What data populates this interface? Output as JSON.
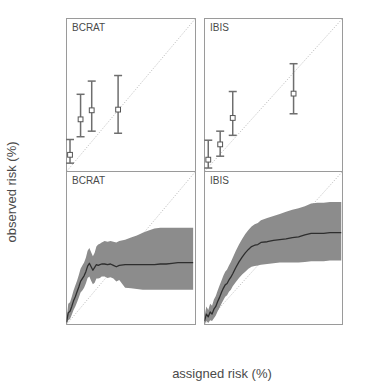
{
  "figure": {
    "xlabel": "assigned risk (%)",
    "ylabel": "observed risk (%)"
  },
  "panels": {
    "top_left_label": "BCRAT",
    "top_right_label": "IBIS",
    "bottom_left_label": "BCRAT",
    "bottom_right_label": "IBIS"
  },
  "axis": {
    "x_ticks": [
      "0",
      "5",
      "10",
      "15",
      "20"
    ],
    "y_ticks": [
      "0",
      "5",
      "10",
      "15",
      "20"
    ],
    "x_tick_values": [
      0,
      5,
      10,
      15,
      20
    ],
    "y_tick_values": [
      0,
      5,
      10,
      15,
      20
    ]
  },
  "colors": {
    "band": "#8c8c8c",
    "curve": "#2e2e2e",
    "errorbar": "#6e6e6e",
    "marker_fill": "#ffffff",
    "diagonal": "#b0b0b0",
    "frame": "#9a9a9a",
    "text": "#4a4a4a"
  },
  "chart_data": [
    {
      "type": "scatter",
      "title": "BCRAT",
      "panel": "top-left",
      "xlabel": "assigned risk (%)",
      "ylabel": "observed risk (%)",
      "xlim": [
        0,
        22
      ],
      "ylim": [
        0,
        22
      ],
      "grid": false,
      "legend": "none",
      "annotations": [
        "diagonal reference line y = x (dotted)"
      ],
      "points": [
        {
          "x": 0.6,
          "y": 2.4,
          "ci_low": 1.2,
          "ci_high": 4.6
        },
        {
          "x": 2.4,
          "y": 7.5,
          "ci_low": 5.0,
          "ci_high": 11.1
        },
        {
          "x": 4.3,
          "y": 8.8,
          "ci_low": 5.8,
          "ci_high": 13.0
        },
        {
          "x": 8.8,
          "y": 8.9,
          "ci_low": 5.5,
          "ci_high": 13.8
        }
      ]
    },
    {
      "type": "scatter",
      "title": "IBIS",
      "panel": "top-right",
      "xlabel": "assigned risk (%)",
      "ylabel": "observed risk (%)",
      "xlim": [
        0,
        22
      ],
      "ylim": [
        0,
        22
      ],
      "grid": false,
      "legend": "none",
      "annotations": [
        "diagonal reference line y = x (dotted)"
      ],
      "points": [
        {
          "x": 0.6,
          "y": 1.7,
          "ci_low": 0.5,
          "ci_high": 4.5
        },
        {
          "x": 2.5,
          "y": 3.9,
          "ci_low": 2.2,
          "ci_high": 5.8
        },
        {
          "x": 4.5,
          "y": 7.7,
          "ci_low": 5.2,
          "ci_high": 11.5
        },
        {
          "x": 14.2,
          "y": 11.2,
          "ci_low": 8.3,
          "ci_high": 15.5
        }
      ]
    },
    {
      "type": "area",
      "title": "BCRAT",
      "panel": "bottom-left",
      "xlabel": "assigned risk (%)",
      "ylabel": "observed risk (%)",
      "xlim": [
        0,
        22
      ],
      "ylim": [
        0,
        22
      ],
      "grid": false,
      "legend": "none",
      "annotations": [
        "diagonal reference line y = x (dotted)",
        "shaded 95% confidence band"
      ],
      "x": [
        0.0,
        0.3,
        0.6,
        0.9,
        1.2,
        1.5,
        1.8,
        2.1,
        2.4,
        2.7,
        3.0,
        3.3,
        3.6,
        3.9,
        4.2,
        4.5,
        4.8,
        5.1,
        5.4,
        5.7,
        6.0,
        6.5,
        7.0,
        7.5,
        8.0,
        8.5,
        9.0,
        10.0,
        11.0,
        12.0,
        13.0,
        14.0,
        15.0,
        16.0,
        17.0,
        18.0,
        19.0,
        20.0,
        21.0,
        21.6
      ],
      "series": [
        {
          "name": "observed risk (smoothed)",
          "values": [
            0.3,
            1.7,
            1.9,
            2.6,
            3.4,
            4.0,
            4.7,
            5.4,
            6.2,
            6.6,
            7.0,
            7.6,
            8.4,
            8.8,
            8.3,
            7.8,
            8.2,
            8.6,
            8.5,
            8.6,
            8.7,
            8.7,
            8.6,
            8.7,
            8.5,
            8.3,
            8.5,
            8.6,
            8.6,
            8.6,
            8.6,
            8.6,
            8.6,
            8.7,
            8.7,
            8.8,
            8.9,
            8.9,
            8.9,
            8.9
          ]
        },
        {
          "name": "lower 95% CI",
          "values": [
            0.0,
            0.6,
            0.8,
            1.4,
            2.1,
            2.6,
            3.2,
            3.9,
            4.6,
            4.9,
            5.3,
            5.9,
            6.7,
            6.9,
            6.3,
            5.8,
            6.0,
            6.6,
            6.6,
            6.7,
            6.9,
            6.9,
            6.7,
            6.8,
            6.6,
            6.2,
            6.4,
            5.3,
            5.2,
            5.1,
            5.0,
            5.0,
            5.0,
            5.0,
            5.0,
            5.0,
            5.0,
            5.0,
            5.0,
            5.0
          ]
        },
        {
          "name": "upper 95% CI",
          "values": [
            0.6,
            3.0,
            3.2,
            4.0,
            4.9,
            5.6,
            6.3,
            7.1,
            8.0,
            8.5,
            8.9,
            9.6,
            10.6,
            11.0,
            10.4,
            9.8,
            10.3,
            11.2,
            11.5,
            11.6,
            11.8,
            12.0,
            11.9,
            12.0,
            11.9,
            11.8,
            12.0,
            12.2,
            12.5,
            12.8,
            13.2,
            13.5,
            13.8,
            13.9,
            13.9,
            13.9,
            13.9,
            13.9,
            13.9,
            13.9
          ]
        }
      ]
    },
    {
      "type": "area",
      "title": "IBIS",
      "panel": "bottom-right",
      "xlabel": "assigned risk (%)",
      "ylabel": "observed risk (%)",
      "xlim": [
        0,
        22
      ],
      "ylim": [
        0,
        22
      ],
      "grid": false,
      "legend": "none",
      "annotations": [
        "diagonal reference line y = x (dotted)",
        "shaded 95% confidence band"
      ],
      "x": [
        0.0,
        0.3,
        0.6,
        0.9,
        1.2,
        1.5,
        1.8,
        2.1,
        2.4,
        2.7,
        3.0,
        3.3,
        3.6,
        3.9,
        4.2,
        4.5,
        5.0,
        5.5,
        6.0,
        6.5,
        7.0,
        7.5,
        8.0,
        8.5,
        9.0,
        10.0,
        11.0,
        12.0,
        13.0,
        14.0,
        15.0,
        16.0,
        17.0,
        18.0,
        19.0,
        20.0,
        21.0,
        21.8
      ],
      "series": [
        {
          "name": "observed risk (smoothed)",
          "values": [
            0.5,
            1.5,
            1.1,
            1.8,
            1.5,
            2.2,
            2.6,
            3.3,
            3.9,
            4.6,
            5.2,
            5.7,
            5.9,
            6.4,
            6.8,
            7.3,
            8.2,
            9.0,
            9.7,
            10.3,
            10.8,
            11.2,
            11.4,
            11.5,
            11.8,
            11.9,
            12.1,
            12.2,
            12.3,
            12.5,
            12.6,
            12.9,
            13.1,
            13.1,
            13.1,
            13.2,
            13.2,
            13.2
          ]
        },
        {
          "name": "lower 95% CI",
          "values": [
            0.0,
            0.5,
            0.2,
            0.6,
            0.5,
            0.9,
            1.3,
            1.9,
            2.4,
            3.0,
            3.5,
            4.0,
            4.2,
            4.7,
            5.0,
            5.5,
            6.1,
            6.7,
            7.2,
            7.6,
            8.0,
            8.3,
            8.4,
            8.5,
            8.6,
            8.7,
            8.8,
            8.9,
            8.9,
            8.9,
            8.9,
            9.0,
            9.1,
            9.1,
            9.1,
            9.2,
            9.2,
            9.2
          ]
        },
        {
          "name": "upper 95% CI",
          "values": [
            1.2,
            2.6,
            2.1,
            3.0,
            2.7,
            3.6,
            4.1,
            4.9,
            5.6,
            6.3,
            7.0,
            7.6,
            7.9,
            8.5,
            9.0,
            9.6,
            10.6,
            11.5,
            12.3,
            13.0,
            13.6,
            14.1,
            14.4,
            14.6,
            15.0,
            15.3,
            15.6,
            15.9,
            16.2,
            16.5,
            16.7,
            17.0,
            17.4,
            17.5,
            17.5,
            17.6,
            17.6,
            17.6
          ]
        }
      ]
    }
  ]
}
